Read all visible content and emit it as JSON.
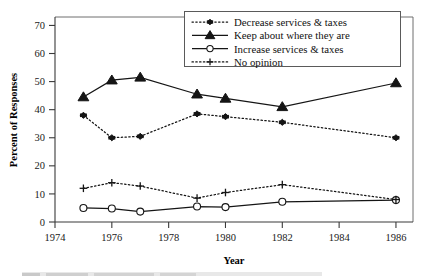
{
  "chart_data": {
    "type": "line",
    "title": "",
    "xlabel": "Year",
    "ylabel": "Percent of Responses",
    "x": [
      1975,
      1976,
      1977,
      1979,
      1980,
      1982,
      1986
    ],
    "xlim": [
      1974,
      1986.6
    ],
    "ylim": [
      0,
      73
    ],
    "xticks": [
      1974,
      1976,
      1978,
      1980,
      1982,
      1984,
      1986
    ],
    "xticklabels": [
      "1974",
      "1976",
      "1978",
      "1980",
      "1982",
      "1984",
      "1986"
    ],
    "yticks": [
      0,
      10,
      20,
      30,
      40,
      50,
      60,
      70
    ],
    "yticklabels": [
      "0",
      "10",
      "20",
      "30",
      "40",
      "50",
      "60",
      "70"
    ],
    "grid": false,
    "legend_position": "top-right",
    "series": [
      {
        "name": "Decrease services & taxes",
        "marker": "diamond",
        "linestyle": "dotted",
        "color": "#151515",
        "values": [
          38,
          30,
          30.5,
          38.5,
          37.5,
          35.5,
          30
        ]
      },
      {
        "name": "Keep about where they are",
        "marker": "triangle",
        "linestyle": "solid",
        "color": "#151515",
        "values": [
          44.5,
          50.5,
          51.5,
          45.5,
          44,
          41,
          49.5
        ]
      },
      {
        "name": "Increase services & taxes",
        "marker": "circle-open",
        "linestyle": "solid",
        "color": "#151515",
        "values": [
          5,
          4.8,
          3.7,
          5.5,
          5.3,
          7.2,
          7.8
        ]
      },
      {
        "name": "No opinion",
        "marker": "plus",
        "linestyle": "dotted",
        "color": "#151515",
        "values": [
          12,
          14,
          12.8,
          8.5,
          10.5,
          13.3,
          8
        ]
      }
    ]
  },
  "axes": {
    "ylabel": "Percent of Responses",
    "xlabel": "Year"
  },
  "legend": {
    "entries": [
      {
        "label": "Decrease services & taxes"
      },
      {
        "label": "Keep about where they are"
      },
      {
        "label": "Increase services & taxes"
      },
      {
        "label": "No opinion"
      }
    ]
  }
}
